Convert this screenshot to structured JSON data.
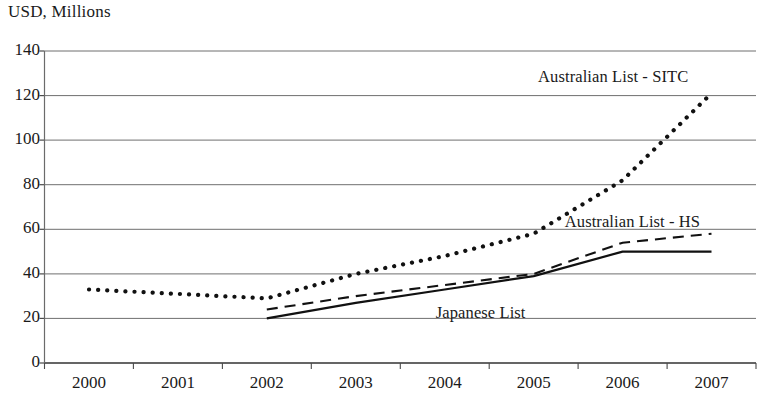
{
  "chart_data": {
    "type": "line",
    "title": "USD, Millions",
    "xlabel": "",
    "ylabel": "USD, Millions",
    "x": [
      2000,
      2001,
      2002,
      2003,
      2004,
      2005,
      2006,
      2007
    ],
    "xtick_labels": [
      "2000",
      "2001",
      "2002",
      "2003",
      "2004",
      "2005",
      "2006",
      "2007"
    ],
    "ytick_labels": [
      "0",
      "20",
      "40",
      "60",
      "80",
      "100",
      "120",
      "140"
    ],
    "ylim": [
      0,
      140
    ],
    "ytick_step": 20,
    "grid": "horizontal",
    "legend_position": "inline-annotations",
    "series": [
      {
        "name": "Australian List - SITC",
        "style": "dotted",
        "color": "#111111",
        "label_x": 2005.05,
        "label_y": 128,
        "x": [
          2000,
          2001,
          2002,
          2003,
          2004,
          2005,
          2006,
          2007
        ],
        "values": [
          33,
          31,
          29,
          40,
          48,
          58,
          82,
          121
        ]
      },
      {
        "name": "Australian List - HS",
        "style": "dashed",
        "color": "#111111",
        "label_x": 2005.35,
        "label_y": 63,
        "x": [
          2002,
          2003,
          2004,
          2005,
          2006,
          2007
        ],
        "values": [
          24,
          30,
          35,
          40,
          54,
          58
        ]
      },
      {
        "name": "Japanese List",
        "style": "solid",
        "color": "#111111",
        "label_x": 2003.9,
        "label_y": 22,
        "x": [
          2002,
          2003,
          2004,
          2005,
          2006,
          2007
        ],
        "values": [
          20,
          27,
          33,
          39,
          50,
          50
        ]
      }
    ]
  },
  "labels": {
    "axis_title": "USD, Millions",
    "series_sitc": "Australian List - SITC",
    "series_hs": "Australian List - HS",
    "series_japanese": "Japanese List"
  }
}
